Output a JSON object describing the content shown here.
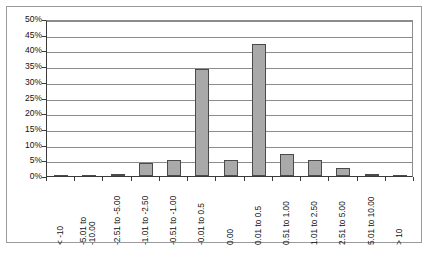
{
  "chart_data": {
    "type": "bar",
    "title": "",
    "subtitle": "",
    "xlabel": "",
    "ylabel": "",
    "grid": true,
    "legend": false,
    "ylim": [
      0,
      50
    ],
    "ytick_labels": [
      "50%",
      "45%",
      "40%",
      "35%",
      "30%",
      "25%",
      "20%",
      "15%",
      "10%",
      "5%",
      "0%"
    ],
    "ytick_values": [
      50,
      45,
      40,
      35,
      30,
      25,
      20,
      15,
      10,
      5,
      0
    ],
    "categories": [
      "< -10",
      "-5.01 to -10.00",
      "-2.51 to -5.00",
      "-1.01 to -2.50",
      "-0.51 to -1.00",
      "-0.01 to 0.5",
      "0.00",
      "0.01 to 0.5",
      "0.51 to 1.00",
      "1.01 to 2.50",
      "2.51 to 5.00",
      "5.01 to 10.00",
      "> 10"
    ],
    "category_lines": [
      [
        "< -10"
      ],
      [
        "-5.01 to",
        "-10.00"
      ],
      [
        "-2.51 to -5.00"
      ],
      [
        "-1.01 to -2.50"
      ],
      [
        "-0.51 to -1.00"
      ],
      [
        "-0.01 to 0.5"
      ],
      [
        "0.00"
      ],
      [
        "0.01 to 0.5"
      ],
      [
        "0.51 to 1.00"
      ],
      [
        "1.01 to 2.50"
      ],
      [
        "2.51 to 5.00"
      ],
      [
        "5.01 to 10.00"
      ],
      [
        "> 10"
      ]
    ],
    "values": [
      0.3,
      0.3,
      0.6,
      4.0,
      5.0,
      34.0,
      5.0,
      42.0,
      7.0,
      5.0,
      2.5,
      0.5,
      0.1
    ],
    "series": [
      {
        "name": "Frequency",
        "values": [
          0.3,
          0.3,
          0.6,
          4.0,
          5.0,
          34.0,
          5.0,
          42.0,
          7.0,
          5.0,
          2.5,
          0.5,
          0.1
        ]
      }
    ],
    "colors": {
      "bar_fill": "#a9a9a9",
      "bar_border": "#4a4a4a",
      "gridline": "#8c8c8c",
      "axis": "#3a3a3a",
      "frame": "#9a9a9a",
      "text": "#111111",
      "background": "#ffffff"
    }
  }
}
